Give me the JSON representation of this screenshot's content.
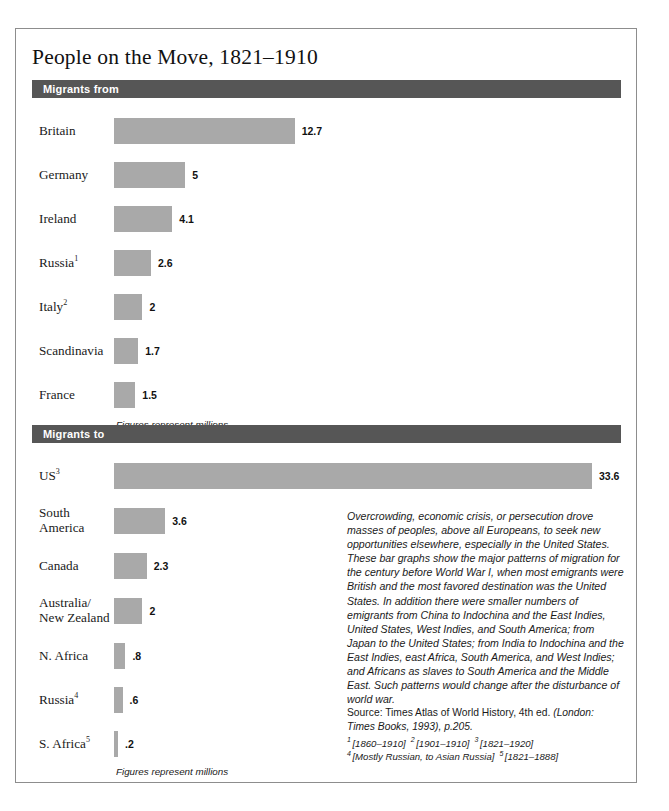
{
  "page": {
    "title": "People on the Move, 1821–1910"
  },
  "sections": {
    "from": {
      "header_label": "Migrants from",
      "figures_note": "Figures represent millions"
    },
    "to": {
      "header_label": "Migrants to",
      "figures_note": "Figures represent millions"
    }
  },
  "chart_data": [
    {
      "type": "bar",
      "title": "Migrants from",
      "orientation": "horizontal",
      "unit": "millions",
      "xlabel": "",
      "ylabel": "",
      "xlim": [
        0,
        33.6
      ],
      "grid": false,
      "legend": "none",
      "categories": [
        "Britain",
        "Germany",
        "Ireland",
        "Russia¹",
        "Italy²",
        "Scandinavia",
        "France"
      ],
      "values": [
        12.7,
        5,
        4.1,
        2.6,
        2,
        1.7,
        1.5
      ],
      "value_labels": [
        "12.7",
        "5",
        "4.1",
        "2.6",
        "2",
        "1.7",
        "1.5"
      ],
      "footnote_markers": [
        "",
        "",
        "",
        "1",
        "2",
        "",
        ""
      ]
    },
    {
      "type": "bar",
      "title": "Migrants to",
      "orientation": "horizontal",
      "unit": "millions",
      "xlabel": "",
      "ylabel": "",
      "xlim": [
        0,
        33.6
      ],
      "grid": false,
      "legend": "none",
      "categories": [
        "US³",
        "South America",
        "Canada",
        "Australia/ New Zealand",
        "N. Africa",
        "Russia⁴",
        "S. Africa⁵"
      ],
      "values": [
        33.6,
        3.6,
        2.3,
        2,
        0.8,
        0.6,
        0.2
      ],
      "value_labels": [
        "33.6",
        "3.6",
        "2.3",
        "2",
        ".8",
        ".6",
        ".2"
      ],
      "footnote_markers": [
        "3",
        "",
        "",
        "",
        "",
        "4",
        "5"
      ]
    }
  ],
  "rows_from": [
    {
      "label": "Britain",
      "sup": "",
      "value": 12.7,
      "value_label": "12.7"
    },
    {
      "label": "Germany",
      "sup": "",
      "value": 5,
      "value_label": "5"
    },
    {
      "label": "Ireland",
      "sup": "",
      "value": 4.1,
      "value_label": "4.1"
    },
    {
      "label": "Russia",
      "sup": "1",
      "value": 2.6,
      "value_label": "2.6"
    },
    {
      "label": "Italy",
      "sup": "2",
      "value": 2,
      "value_label": "2"
    },
    {
      "label": "Scandinavia",
      "sup": "",
      "value": 1.7,
      "value_label": "1.7"
    },
    {
      "label": "France",
      "sup": "",
      "value": 1.5,
      "value_label": "1.5"
    }
  ],
  "rows_to": [
    {
      "label": "US",
      "sup": "3",
      "value": 33.6,
      "value_label": "33.6"
    },
    {
      "label": "South\nAmerica",
      "sup": "",
      "value": 3.6,
      "value_label": "3.6"
    },
    {
      "label": "Canada",
      "sup": "",
      "value": 2.3,
      "value_label": "2.3"
    },
    {
      "label": "Australia/\nNew Zealand",
      "sup": "",
      "value": 2,
      "value_label": "2"
    },
    {
      "label": "N. Africa",
      "sup": "",
      "value": 0.8,
      "value_label": ".8"
    },
    {
      "label": "Russia",
      "sup": "4",
      "value": 0.6,
      "value_label": ".6"
    },
    {
      "label": "S. Africa",
      "sup": "5",
      "value": 0.2,
      "value_label": ".2"
    }
  ],
  "caption": {
    "body": "Overcrowding, economic crisis, or persecution drove masses of peoples, above all Europeans, to seek new opportunities elsewhere, especially in the United States. These bar graphs show the major patterns of migration for the century before World War I, when most emigrants were British and the most favored destination was the United States. In addition there were smaller numbers of emigrants from China to Indochina and the East Indies, United States, West Indies, and South America; from Japan to the United States; from India to Indochina and the East Indies, east Africa, South America, and West Indies; and Africans as slaves to South America and the Middle East. Such patterns would change after the disturbance of world war.",
    "source_prefix": "Source: Times Atlas of World History, 4th ed. ",
    "source_italic": "(London: Times Books, 1993), p.205.",
    "footnotes": [
      {
        "num": "1",
        "text": "[1860–1910]"
      },
      {
        "num": "2",
        "text": "[1901–1910]"
      },
      {
        "num": "3",
        "text": "[1821–1920]"
      },
      {
        "num": "4",
        "text": "[Mostly Russian, to Asian Russia]"
      },
      {
        "num": "5",
        "text": "[1821–1888]"
      }
    ]
  },
  "colors": {
    "bar_fill": "#a9a9a9",
    "header_bar": "#565656",
    "frame_border": "#8d8d8d",
    "text": "#1a1a1a"
  }
}
